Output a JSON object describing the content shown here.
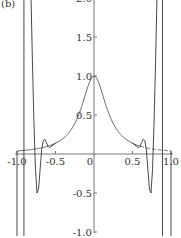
{
  "chart_data": {
    "type": "line",
    "panel_label": "(b)",
    "title": "",
    "xlabel": "",
    "ylabel": "",
    "xlim": [
      -1.0,
      1.0
    ],
    "ylim": [
      -1.0,
      2.0
    ],
    "grid": false,
    "x_ticks": [
      -1.0,
      -0.5,
      0.5,
      1.0
    ],
    "x_tick_labels": [
      "-1.0",
      "-0.5",
      "0.5",
      "1.0"
    ],
    "y_ticks": [
      2.0,
      1.5,
      1.0,
      0.5,
      -0.5,
      -1.0
    ],
    "y_tick_labels": [
      "2.0",
      "1.5",
      "1.0",
      "0.5",
      "-0.5",
      "-1.0"
    ],
    "series": [
      {
        "name": "runge-function",
        "style": "solid",
        "formula": "1/(1+25x^2)",
        "x": [
          -1.0,
          -0.9,
          -0.8,
          -0.7,
          -0.6,
          -0.5,
          -0.4,
          -0.3,
          -0.2,
          -0.1,
          0.0,
          0.1,
          0.2,
          0.3,
          0.4,
          0.5,
          0.6
        ],
        "y": [
          0.038,
          0.047,
          0.059,
          0.075,
          0.1,
          0.138,
          0.2,
          0.308,
          0.5,
          0.8,
          1.0,
          0.8,
          0.5,
          0.308,
          0.2,
          0.138,
          0.1
        ]
      },
      {
        "name": "runge-function-tail",
        "style": "dashed",
        "x": [
          0.6,
          0.7,
          0.8,
          0.9,
          1.0
        ],
        "y": [
          0.1,
          0.075,
          0.059,
          0.047,
          0.038
        ]
      },
      {
        "name": "interpolant-left",
        "style": "solid",
        "x": [
          -0.82,
          -0.8,
          -0.78,
          -0.76,
          -0.74,
          -0.72,
          -0.7,
          -0.68,
          -0.66,
          -0.64,
          -0.62,
          -0.6,
          -0.58,
          -0.55,
          -0.5
        ],
        "y": [
          2.1,
          1.2,
          0.4,
          -0.2,
          -0.5,
          -0.45,
          -0.2,
          0.05,
          0.17,
          0.19,
          0.15,
          0.1,
          0.08,
          0.1,
          0.14
        ]
      },
      {
        "name": "interpolant-right",
        "style": "solid",
        "x": [
          0.5,
          0.55,
          0.58,
          0.6,
          0.62,
          0.64,
          0.66,
          0.68,
          0.7,
          0.72,
          0.74,
          0.76,
          0.78,
          0.8,
          0.82
        ],
        "y": [
          0.14,
          0.1,
          0.08,
          0.1,
          0.15,
          0.19,
          0.17,
          0.05,
          -0.2,
          -0.45,
          -0.5,
          -0.2,
          0.4,
          1.2,
          2.1
        ]
      },
      {
        "name": "interpolant-left-outer",
        "style": "solid",
        "x": [
          -0.91,
          -0.91
        ],
        "y": [
          2.1,
          -1.05
        ]
      },
      {
        "name": "interpolant-right-outer",
        "style": "solid",
        "x": [
          0.89,
          0.89
        ],
        "y": [
          2.1,
          -1.05
        ]
      },
      {
        "name": "interpolant-left-end",
        "style": "solid",
        "x": [
          -1.0,
          -1.0
        ],
        "y": [
          0.04,
          -1.05
        ]
      },
      {
        "name": "interpolant-right-end",
        "style": "solid",
        "x": [
          1.0,
          1.0
        ],
        "y": [
          0.04,
          -1.05
        ]
      }
    ]
  }
}
